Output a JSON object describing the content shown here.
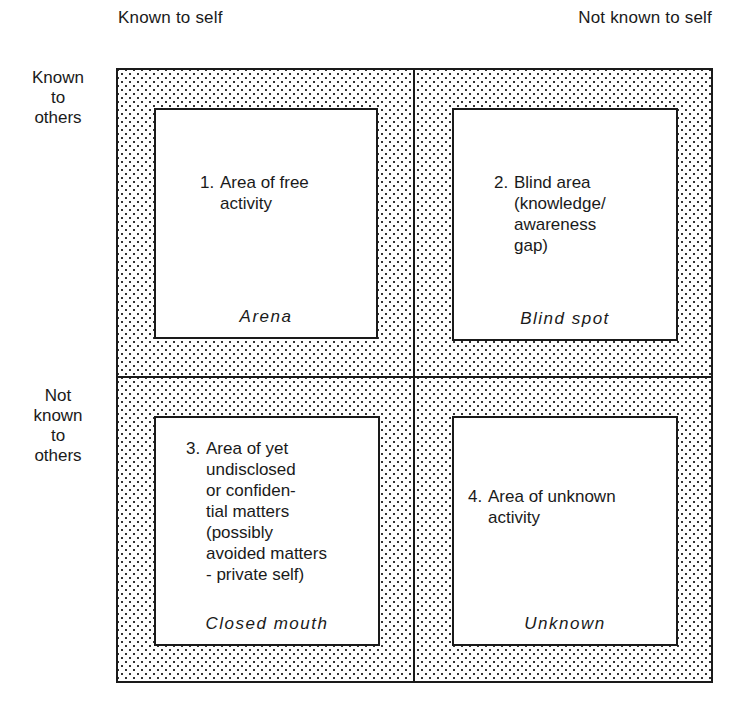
{
  "columns": {
    "left": "Known to self",
    "right": "Not known to self"
  },
  "rows": {
    "top": [
      "Known",
      "to",
      "others"
    ],
    "bottom": [
      "Not",
      "known",
      "to",
      "others"
    ]
  },
  "quadrants": [
    {
      "number": "1.",
      "lines": [
        "Area of free",
        "activity"
      ],
      "name": "Arena"
    },
    {
      "number": "2.",
      "lines": [
        "Blind area",
        "(knowledge/",
        "awareness",
        "gap)"
      ],
      "name": "Blind spot"
    },
    {
      "number": "3.",
      "lines": [
        "Area of yet",
        "undisclosed",
        "or confiden-",
        "tial matters",
        "(possibly",
        "avoided matters",
        "- private self)"
      ],
      "name": "Closed mouth"
    },
    {
      "number": "4.",
      "lines": [
        "Area of unknown",
        "activity"
      ],
      "name": "Unknown"
    }
  ]
}
